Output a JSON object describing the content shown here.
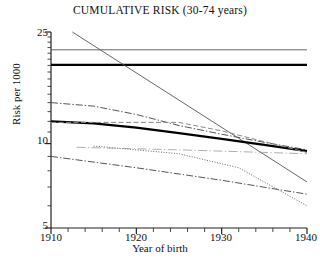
{
  "chart_data": {
    "type": "line",
    "title": "CUMULATIVE RISK (30-74 years)",
    "xlabel": "Year of birth",
    "ylabel": "Risk per 1000",
    "xlim": [
      1910,
      1940
    ],
    "ylim": [
      5,
      25
    ],
    "yscale": "log",
    "grid": false,
    "legend": "none",
    "ytick_labels": [
      "25",
      "10",
      "5"
    ],
    "ytick_values": [
      25,
      10,
      5
    ],
    "xtick_labels": [
      "1910",
      "1920",
      "1930",
      "1940"
    ],
    "xtick_values": [
      1910,
      1920,
      1930,
      1940
    ],
    "xminor_step": 2,
    "series": [
      {
        "name": "series-1-thin-solid-upper",
        "style": "solid-thin",
        "color": "#555555",
        "x": [
          1910,
          1940
        ],
        "y": [
          21.6,
          21.6
        ]
      },
      {
        "name": "series-2-thick-solid-upper",
        "style": "solid-thick",
        "color": "#000000",
        "x": [
          1910,
          1940
        ],
        "y": [
          19.1,
          19.1
        ]
      },
      {
        "name": "series-3-steep-solid-decline",
        "style": "solid-thin",
        "color": "#555555",
        "x": [
          1912.5,
          1940
        ],
        "y": [
          25.0,
          7.3
        ]
      },
      {
        "name": "series-4-dashdot-upper",
        "style": "dashdot",
        "color": "#555555",
        "x": [
          1910,
          1915,
          1920,
          1925,
          1930,
          1935,
          1940
        ],
        "y": [
          14.0,
          13.6,
          12.7,
          11.6,
          10.8,
          10.1,
          9.5
        ]
      },
      {
        "name": "series-5-thick-solid-middle",
        "style": "solid-thick",
        "color": "#000000",
        "x": [
          1910,
          1915,
          1920,
          1925,
          1930,
          1935,
          1940
        ],
        "y": [
          12.0,
          11.8,
          11.4,
          10.9,
          10.4,
          9.9,
          9.4
        ]
      },
      {
        "name": "series-6-dashed-flat",
        "style": "dashed",
        "color": "#888888",
        "x": [
          1910,
          1925,
          1930,
          1940
        ],
        "y": [
          11.9,
          11.9,
          11.1,
          9.3
        ]
      },
      {
        "name": "series-7-dotted-decline",
        "style": "dotted",
        "color": "#666666",
        "x": [
          1915,
          1925,
          1932,
          1940
        ],
        "y": [
          9.8,
          9.2,
          8.2,
          6.0
        ]
      },
      {
        "name": "series-8-dashdot-lower",
        "style": "dashdot",
        "color": "#555555",
        "x": [
          1910,
          1920,
          1930,
          1940
        ],
        "y": [
          9.0,
          8.2,
          7.4,
          6.6
        ]
      },
      {
        "name": "series-9-thin-flat-lower",
        "style": "dashdot-fine",
        "color": "#999999",
        "x": [
          1913,
          1925,
          1940
        ],
        "y": [
          9.7,
          9.5,
          9.2
        ]
      }
    ]
  },
  "axes": {
    "title": "CUMULATIVE RISK (30-74 years)",
    "ylabel": "Risk per 1000",
    "xlabel": "Year of birth",
    "yticks": [
      "25",
      "10",
      "5"
    ],
    "xticks": [
      "1910",
      "1920",
      "1930",
      "1940"
    ]
  }
}
